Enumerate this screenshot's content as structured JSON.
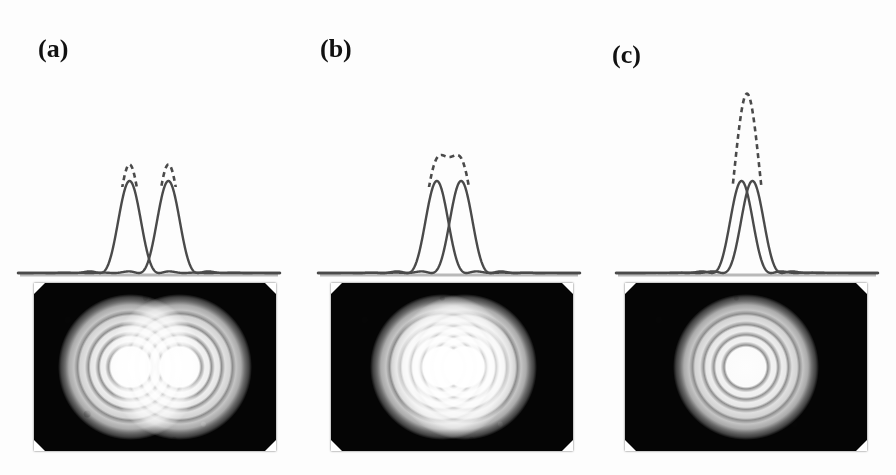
{
  "figure": {
    "background_color": "#fdfdfd",
    "curve_color": "#4a4a4a",
    "baseline_color": "#b9b9b9",
    "photo_background_color": "#050505"
  },
  "panels": [
    {
      "label": "(a)",
      "label_x": 38,
      "label_y": 36,
      "condition": "well resolved",
      "separation": 1.6,
      "solid_peak_height": 0.78,
      "dashed_peak_height": 0.92,
      "dashed_dip_depth": 0.74,
      "plot": {
        "x": 18,
        "y": 80,
        "width": 262,
        "height": 196,
        "baseline_y": 193
      },
      "photo": {
        "x": 34,
        "y": 283,
        "width": 242,
        "height": 168
      },
      "photo_discs": [
        {
          "cx": 40,
          "cy": 50,
          "r": 30
        },
        {
          "cx": 60,
          "cy": 50,
          "r": 30
        }
      ]
    },
    {
      "label": "(b)",
      "label_x": 320,
      "label_y": 36,
      "condition": "just resolved (Rayleigh criterion)",
      "separation": 1.0,
      "solid_peak_height": 0.78,
      "dashed_peak_height": 1.0,
      "dashed_dip_depth": 0.56,
      "plot": {
        "x": 318,
        "y": 80,
        "width": 262,
        "height": 196,
        "baseline_y": 193
      },
      "photo": {
        "x": 331,
        "y": 283,
        "width": 242,
        "height": 168
      },
      "photo_discs": [
        {
          "cx": 46,
          "cy": 50,
          "r": 30
        },
        {
          "cx": 55,
          "cy": 50,
          "r": 30
        }
      ]
    },
    {
      "label": "(c)",
      "label_x": 612,
      "label_y": 42,
      "condition": "not resolved",
      "separation": 0.45,
      "solid_peak_height": 0.78,
      "dashed_peak_height": 1.52,
      "dashed_dip_depth": 1.5,
      "plot": {
        "x": 616,
        "y": 80,
        "width": 262,
        "height": 196,
        "baseline_y": 193
      },
      "photo": {
        "x": 625,
        "y": 283,
        "width": 242,
        "height": 168
      },
      "photo_discs": [
        {
          "cx": 50,
          "cy": 50,
          "r": 30
        }
      ]
    }
  ],
  "curves": {
    "solid_legend": "individual Airy diffraction patterns",
    "dashed_legend": "sum of the two patterns"
  },
  "chart_data": {
    "type": "line",
    "xlabel": "",
    "ylabel": "",
    "xlim": [
      -5.5,
      5.5
    ],
    "ylim": [
      0,
      1.6
    ],
    "grid": false,
    "legend": "none",
    "panels": [
      {
        "name": "(a)",
        "separation_in_airy_units": 1.6,
        "series": [
          {
            "name": "source 1 (solid)",
            "style": "solid",
            "peak_x": -0.8,
            "peak_y": 0.78
          },
          {
            "name": "source 2 (solid)",
            "style": "solid",
            "peak_x": 0.8,
            "peak_y": 0.78
          },
          {
            "name": "sum (dashed)",
            "style": "dashed",
            "peaks": [
              0.92,
              0.92
            ],
            "central_dip": 0.1
          }
        ]
      },
      {
        "name": "(b)",
        "separation_in_airy_units": 1.0,
        "series": [
          {
            "name": "source 1 (solid)",
            "style": "solid",
            "peak_x": -0.5,
            "peak_y": 0.78
          },
          {
            "name": "source 2 (solid)",
            "style": "solid",
            "peak_x": 0.5,
            "peak_y": 0.78
          },
          {
            "name": "sum (dashed)",
            "style": "dashed",
            "peaks": [
              1.0,
              1.0
            ],
            "central_dip": 0.56
          }
        ]
      },
      {
        "name": "(c)",
        "separation_in_airy_units": 0.45,
        "series": [
          {
            "name": "source 1 (solid)",
            "style": "solid",
            "peak_x": -0.22,
            "peak_y": 0.78
          },
          {
            "name": "source 2 (solid)",
            "style": "solid",
            "peak_x": 0.22,
            "peak_y": 0.78
          },
          {
            "name": "sum (dashed)",
            "style": "dashed",
            "peaks": [
              1.52
            ],
            "central_dip": null
          }
        ]
      }
    ]
  }
}
